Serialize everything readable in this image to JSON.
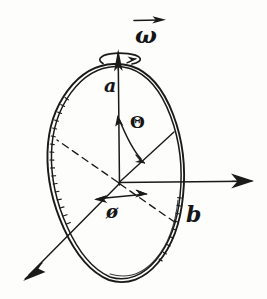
{
  "figure": {
    "background_color": "#fdfdfc",
    "ink_color": "#1a1a1a",
    "labels": {
      "omega": "ω",
      "axis_a": "a",
      "axis_b": "b",
      "theta": "Θ",
      "phi": "ø"
    },
    "elements": [
      {
        "name": "ring-ellipse",
        "kind": "ellipse",
        "style": "double-stroke sketch"
      },
      {
        "name": "rotation-axis",
        "kind": "line",
        "style": "vertical with up arrowhead"
      },
      {
        "name": "spin-indicator",
        "kind": "ellipse",
        "style": "small flat ellipse with arrowhead"
      },
      {
        "name": "omega-vector-bar",
        "kind": "arrow",
        "style": "short right arrow over label"
      },
      {
        "name": "horizontal-axis-arrow",
        "kind": "arrow",
        "style": "points right"
      },
      {
        "name": "diagonal-axis-arrow",
        "kind": "arrow",
        "style": "points down-left"
      },
      {
        "name": "radius-line",
        "kind": "line",
        "style": "from centre up-right to rim"
      },
      {
        "name": "dashed-upper-left",
        "kind": "line",
        "style": "dashed"
      },
      {
        "name": "dashed-lower-right",
        "kind": "line",
        "style": "dashed"
      },
      {
        "name": "theta-arc-arrow",
        "kind": "arc",
        "style": "double headed"
      },
      {
        "name": "phi-arrow",
        "kind": "arrow",
        "style": "double headed, horizontal"
      }
    ]
  }
}
